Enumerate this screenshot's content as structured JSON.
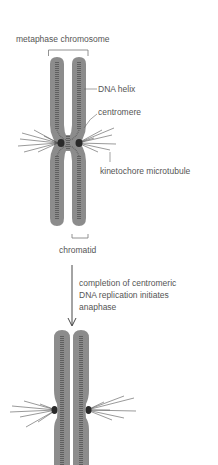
{
  "diagram": {
    "labels": {
      "metaphase_chromosome": "metaphase chromosome",
      "dna_helix": "DNA helix",
      "centromere": "centromere",
      "kinetochore_microtubule": "kinetochore microtubule",
      "chromatid": "chromatid"
    },
    "transition": {
      "caption_lines": [
        "completion of centromeric",
        "DNA replication initiates",
        "anaphase"
      ]
    },
    "colors": {
      "chromatid_fill": "#8c8c8c",
      "chromatid_inner": "#a6a6a6",
      "dna_ladder": "#4a4a4a",
      "kinetochore": "#2a2a2a",
      "microtubule": "#555555",
      "label_text": "#555555"
    }
  }
}
